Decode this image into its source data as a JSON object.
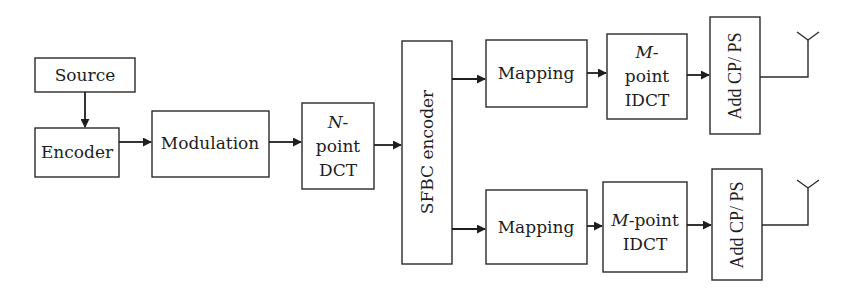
{
  "diagram": {
    "type": "block-diagram",
    "colors": {
      "stroke": "#2a2a2a",
      "background": "#ffffff",
      "text": "#1e1e1e"
    },
    "blocks": {
      "source": {
        "label": "Source"
      },
      "encoder": {
        "label": "Encoder"
      },
      "modulation": {
        "label": "Modulation"
      },
      "ndct": {
        "line1_italic": "N",
        "line1_rest": "-",
        "line2": "point",
        "line3": "DCT"
      },
      "sfbc": {
        "label": "SFBC encoder"
      },
      "mapping_top": {
        "label": "Mapping"
      },
      "idct_top": {
        "line1_italic": "M",
        "line1_rest": "-",
        "line2": "point",
        "line3": "IDCT"
      },
      "cp_top": {
        "label": "Add CP/ PS"
      },
      "mapping_bottom": {
        "label": "Mapping"
      },
      "idct_bottom": {
        "line1_italic": "M",
        "line1_rest": "-point",
        "line2": "IDCT"
      },
      "cp_bottom": {
        "label": "Add CP/ PS"
      }
    },
    "connections": [
      [
        "Source",
        "Encoder"
      ],
      [
        "Encoder",
        "Modulation"
      ],
      [
        "Modulation",
        "N-point DCT"
      ],
      [
        "N-point DCT",
        "SFBC encoder"
      ],
      [
        "SFBC encoder",
        "Mapping (top)"
      ],
      [
        "Mapping (top)",
        "M-point IDCT (top)"
      ],
      [
        "M-point IDCT (top)",
        "Add CP/ PS (top)"
      ],
      [
        "Add CP/ PS (top)",
        "Antenna (top)"
      ],
      [
        "SFBC encoder",
        "Mapping (bottom)"
      ],
      [
        "Mapping (bottom)",
        "M-point IDCT (bottom)"
      ],
      [
        "M-point IDCT (bottom)",
        "Add CP/ PS (bottom)"
      ],
      [
        "Add CP/ PS (bottom)",
        "Antenna (bottom)"
      ]
    ]
  }
}
